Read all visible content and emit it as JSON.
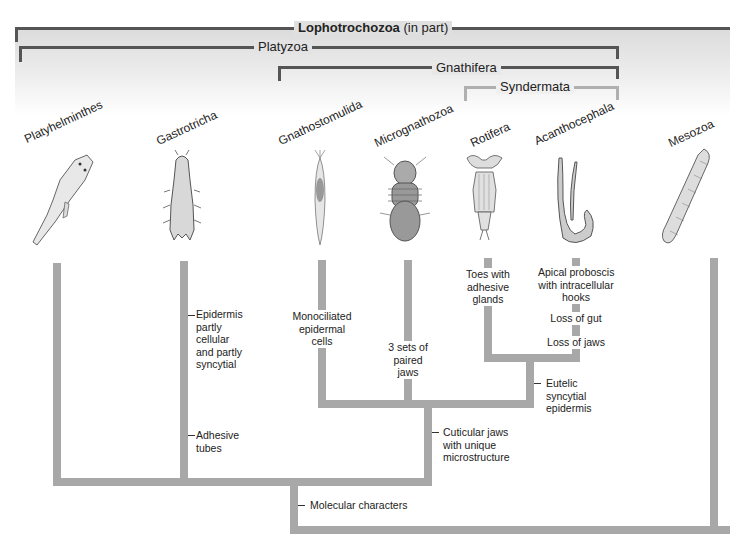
{
  "clades": {
    "lophotrochozoa": {
      "name": "Lophotrochozoa",
      "suffix": "(in part)"
    },
    "platyzoa": {
      "name": "Platyzoa"
    },
    "gnathifera": {
      "name": "Gnathifera"
    },
    "syndermata": {
      "name": "Syndermata"
    }
  },
  "taxa": [
    {
      "name": "Platyhelminthes",
      "organism": "flatworm"
    },
    {
      "name": "Gastrotricha",
      "organism": "gastrotrich"
    },
    {
      "name": "Gnathostomulida",
      "organism": "gnathostomulid"
    },
    {
      "name": "Micrognathozoa",
      "organism": "micrognathozoan"
    },
    {
      "name": "Rotifera",
      "organism": "rotifer"
    },
    {
      "name": "Acanthocephala",
      "organism": "spiny-headed-worm"
    },
    {
      "name": "Mesozoa",
      "organism": "mesozoan"
    }
  ],
  "characters": {
    "epidermis": "Epidermis\npartly\ncellular\nand partly\nsyncytial",
    "adhesive_tubes": "Adhesive\ntubes",
    "monociliated": "Monociliated\nepidermal\ncells",
    "three_jaws": "3 sets of\npaired\njaws",
    "toes": "Toes with\nadhesive\nglands",
    "apical": "Apical proboscis\nwith intracellular\nhooks",
    "loss_gut": "Loss of gut",
    "loss_jaws": "Loss of jaws",
    "eutelic": "Eutelic\nsyncytial\nepidermis",
    "cuticular": "Cuticular jaws\nwith unique\nmicrostructure",
    "molecular": "Molecular characters"
  },
  "colors": {
    "bracket_dark": "#555555",
    "bracket_light": "#b0b0b0",
    "branch": "#a8a8a8",
    "band_top": "#dcdcdc"
  }
}
